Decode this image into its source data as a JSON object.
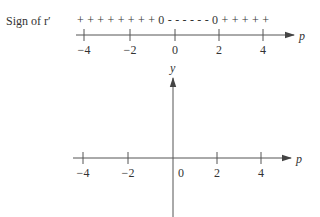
{
  "top_line": {
    "label": "Sign of r′",
    "signs": "+ + + + + + + + 0 - - - - - - 0 + + + + +",
    "sign_segments": [
      {
        "interval": "p < 0",
        "sign": "+"
      },
      {
        "at": "p = 0",
        "sign": "0"
      },
      {
        "interval": "0 < p < 2",
        "sign": "-"
      },
      {
        "at": "p = 2",
        "sign": "0"
      },
      {
        "interval": "p > 2",
        "sign": "+"
      }
    ],
    "axis_label": "p",
    "ticks": [
      "−4",
      "−2",
      "0",
      "2",
      "4"
    ]
  },
  "bottom_plot": {
    "x_axis_label": "p",
    "y_axis_label": "y",
    "ticks": [
      "−4",
      "−2",
      "0",
      "2",
      "4"
    ]
  }
}
